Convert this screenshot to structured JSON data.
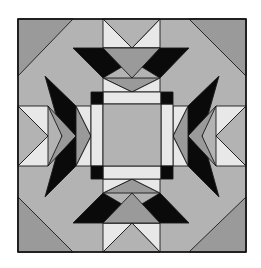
{
  "colors": {
    "dark_gray": "#9a9a9a",
    "mid_gray": "#b3b3b3",
    "light": "#e8e8e8",
    "black": "#0a0a0a",
    "background": "#ffffff"
  },
  "block": {
    "x": 18,
    "y": 19,
    "width": 228,
    "height": 233
  },
  "pieces": [
    {
      "name": "background-field",
      "fill": "mid_gray",
      "points": "18,19 246,19 246,252 18,252"
    },
    {
      "name": "corner-top-left",
      "fill": "dark_gray",
      "points": "18,19 73,19 18,76"
    },
    {
      "name": "corner-top-right",
      "fill": "dark_gray",
      "points": "189,19 246,19 246,76"
    },
    {
      "name": "corner-bottom-left",
      "fill": "dark_gray",
      "points": "18,197 18,252 73,252"
    },
    {
      "name": "corner-bottom-right",
      "fill": "dark_gray",
      "points": "246,197 246,252 189,252"
    },
    {
      "name": "top-goose-left-light",
      "fill": "light",
      "points": "103,19 132,48 103,48"
    },
    {
      "name": "top-goose-right-light",
      "fill": "light",
      "points": "160,19 160,48 132,48"
    },
    {
      "name": "top-goose-gray",
      "fill": "mid_gray",
      "points": "103,19 160,19 132,48"
    },
    {
      "name": "top-chevron-black",
      "fill": "black",
      "points": "73,48 189,48 160,78 132,61 103,78"
    },
    {
      "name": "top-chevron-center",
      "fill": "dark_gray",
      "points": "103,48 160,48 132,78"
    },
    {
      "name": "top-inner-goose-gray",
      "fill": "dark_gray",
      "points": "103,78 160,78 132,92"
    },
    {
      "name": "top-inner-light-left",
      "fill": "light",
      "points": "103,78 132,92 103,92"
    },
    {
      "name": "top-inner-light-right",
      "fill": "light",
      "points": "160,78 160,92 132,92"
    },
    {
      "name": "bottom-goose-left-light",
      "fill": "light",
      "points": "103,252 132,223 103,223"
    },
    {
      "name": "bottom-goose-right-light",
      "fill": "light",
      "points": "160,252 160,223 132,223"
    },
    {
      "name": "bottom-goose-gray",
      "fill": "mid_gray",
      "points": "103,252 160,252 132,223"
    },
    {
      "name": "bottom-chevron-black",
      "fill": "black",
      "points": "73,223 189,223 160,193 132,210 103,193"
    },
    {
      "name": "bottom-chevron-center",
      "fill": "dark_gray",
      "points": "103,223 160,223 132,193"
    },
    {
      "name": "bottom-inner-goose-gray",
      "fill": "dark_gray",
      "points": "103,193 160,193 132,179"
    },
    {
      "name": "bottom-inner-light-left",
      "fill": "light",
      "points": "103,193 132,179 103,179"
    },
    {
      "name": "bottom-inner-light-right",
      "fill": "light",
      "points": "160,193 160,179 132,179"
    },
    {
      "name": "left-goose-top-light",
      "fill": "light",
      "points": "18,106 48,106 48,136"
    },
    {
      "name": "left-goose-bottom-light",
      "fill": "light",
      "points": "18,166 48,166 48,136"
    },
    {
      "name": "left-goose-gray",
      "fill": "mid_gray",
      "points": "18,106 48,136 18,166"
    },
    {
      "name": "left-chevron-black",
      "fill": "black",
      "points": "45,76 76,106 91,136 76,166 45,197 62,136"
    },
    {
      "name": "left-chevron-center",
      "fill": "dark_gray",
      "points": "48,106 76,136 48,166 62,136"
    },
    {
      "name": "left-inner-goose-gray",
      "fill": "dark_gray",
      "points": "76,106 91,136 76,166"
    },
    {
      "name": "left-inner-light-top",
      "fill": "light",
      "points": "76,106 91,106 91,136"
    },
    {
      "name": "left-inner-light-bottom",
      "fill": "light",
      "points": "76,166 91,166 91,136"
    },
    {
      "name": "right-goose-top-light",
      "fill": "light",
      "points": "246,106 216,106 216,136"
    },
    {
      "name": "right-goose-bottom-light",
      "fill": "light",
      "points": "246,166 216,166 216,136"
    },
    {
      "name": "right-goose-gray",
      "fill": "mid_gray",
      "points": "246,106 216,136 246,166"
    },
    {
      "name": "right-chevron-black",
      "fill": "black",
      "points": "219,76 188,106 173,136 188,166 219,197 202,136"
    },
    {
      "name": "right-chevron-center",
      "fill": "dark_gray",
      "points": "216,106 188,136 216,166 202,136"
    },
    {
      "name": "right-inner-goose-gray",
      "fill": "dark_gray",
      "points": "188,106 173,136 188,166"
    },
    {
      "name": "right-inner-light-top",
      "fill": "light",
      "points": "188,106 173,106 173,136"
    },
    {
      "name": "right-inner-light-bottom",
      "fill": "light",
      "points": "188,166 173,166 173,136"
    },
    {
      "name": "frame-top-strip",
      "fill": "light",
      "points": "103,92 161,92 161,104 103,104"
    },
    {
      "name": "frame-bottom-strip",
      "fill": "light",
      "points": "103,166 161,166 161,179 103,179"
    },
    {
      "name": "frame-left-strip",
      "fill": "light",
      "points": "91,104 103,104 103,166 91,166"
    },
    {
      "name": "frame-right-strip",
      "fill": "light",
      "points": "161,104 173,104 173,166 161,166"
    },
    {
      "name": "corner-square-top-left",
      "fill": "black",
      "points": "91,92 103,92 103,104 91,104"
    },
    {
      "name": "corner-square-top-right",
      "fill": "black",
      "points": "161,92 173,92 173,104 161,104"
    },
    {
      "name": "corner-square-bottom-left",
      "fill": "black",
      "points": "91,166 103,166 103,179 91,179"
    },
    {
      "name": "corner-square-bottom-right",
      "fill": "black",
      "points": "161,166 173,166 173,179 161,179"
    },
    {
      "name": "center-square",
      "fill": "mid_gray",
      "points": "103,104 161,104 161,166 103,166"
    }
  ]
}
